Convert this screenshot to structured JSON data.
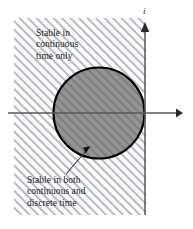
{
  "figure": {
    "axes": {
      "vertical_label": "i",
      "vertical_label_name": "imaginary-axis-label",
      "horizontal_label": "",
      "origin_x": 145,
      "origin_y": 113
    },
    "captions": {
      "continuous_only": {
        "line1": "Stable in",
        "line2": "continuous",
        "line3": "time only"
      },
      "both": {
        "line1": "Stable in both",
        "line2": "continuous and",
        "line3": "discrete time"
      }
    },
    "regions": {
      "hatched": {
        "name": "left-half-plane-hatched-region",
        "description": "Stable in continuous time only",
        "fill": "#ffffff",
        "hatch_color": "#b9bcc4"
      },
      "disk": {
        "name": "unit-disk-region",
        "description": "Stable in both continuous and discrete time",
        "fill": "#8f8f8f",
        "stroke": "#000000",
        "center_x": 99,
        "center_y": 113,
        "radius": 46
      }
    },
    "colors": {
      "background": "#ffffff",
      "axis": "#4a4a4a",
      "outline": "#000000",
      "text": "#1b1b1b",
      "hatch": "#b9bcc4",
      "disk_fill": "#8f8f8f"
    }
  }
}
